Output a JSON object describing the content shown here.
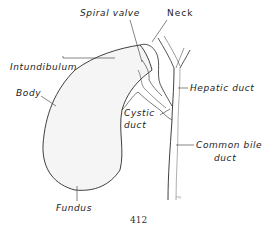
{
  "figure": {
    "labels": {
      "spiral_valve": "Spiral valve",
      "neck": "Neck",
      "intundibulum": "Intundibulum",
      "body": "Body",
      "hepatic_duct": "Hepatic duct",
      "cystic_duct_line1": "Cystic",
      "cystic_duct_line2": "duct",
      "common_bile_duct_line1": "Common bile",
      "common_bile_duct_line2": "duct",
      "fundus": "Fundus"
    },
    "artist_signature": "hrg",
    "page_number": "412"
  },
  "colors": {
    "line": "#2a2a2a",
    "organ_fill": "#f4f4f4",
    "duct_fill": "#f0f0f0",
    "background": "#ffffff"
  }
}
